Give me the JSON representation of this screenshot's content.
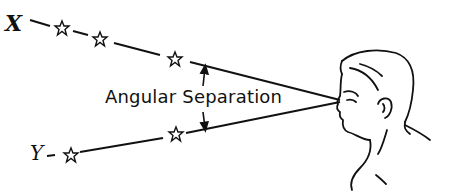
{
  "diagram": {
    "title": "Angular Separation",
    "labels": {
      "star_x": "X",
      "star_y": "Y",
      "separation": "Angular Separation"
    },
    "colors": {
      "ink": "#111111",
      "background": "#ffffff"
    },
    "elements": [
      {
        "type": "star-row",
        "label": "X",
        "stars": 3
      },
      {
        "type": "star-row",
        "label": "Y",
        "stars": 2
      },
      {
        "type": "observer",
        "description": "man's head in profile looking left"
      },
      {
        "type": "angle-arrows",
        "label": "Angular Separation"
      }
    ]
  }
}
